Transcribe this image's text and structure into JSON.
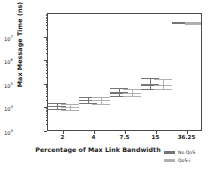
{
  "chart_data": {
    "type": "scatter",
    "title": "",
    "xlabel": "Percentage of Max Link Bandwidth",
    "ylabel": "Max Message Time (ns)",
    "yscale": "log",
    "ylim": [
      1000,
      100000000
    ],
    "grid": false,
    "legend_position": "below-right",
    "categories": [
      "2",
      "4",
      "7.5",
      "15",
      "36.25"
    ],
    "ytick_labels": [
      "10³",
      "10⁴",
      "10⁵",
      "10⁶",
      "10⁷"
    ],
    "ytick_values": [
      1000,
      10000,
      100000,
      1000000,
      10000000
    ],
    "ytick_bases": [
      "10",
      "10",
      "10",
      "10",
      "10"
    ],
    "ytick_exponents": [
      "3",
      "4",
      "5",
      "6",
      "7"
    ],
    "series": [
      {
        "name": "No QoS",
        "color": "#757575",
        "mean": [
          12000,
          22000,
          45000,
          98000,
          42000000
        ],
        "lower": [
          8500,
          15000,
          31000,
          62000,
          36000000
        ],
        "upper": [
          17000,
          31000,
          70000,
          185000,
          48000000
        ]
      },
      {
        "name": "QoS-i",
        "color": "#b0b0b0",
        "mean": [
          11000,
          21000,
          44000,
          95000,
          40000000
        ],
        "lower": [
          8000,
          14500,
          30000,
          58000,
          35000000
        ],
        "upper": [
          16000,
          30000,
          68000,
          175000,
          46000000
        ]
      }
    ]
  },
  "legend": {
    "items": [
      {
        "label": "No QoS",
        "color": "#757575"
      },
      {
        "label": "QoS-i",
        "color": "#b0b0b0"
      }
    ]
  },
  "axes": {
    "frame_color": "#4a4a4a",
    "background": "#ffffff"
  }
}
